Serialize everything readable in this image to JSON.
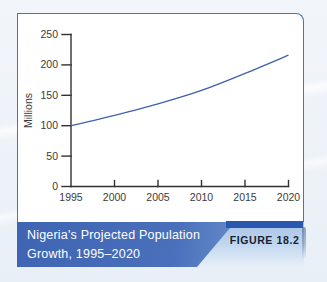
{
  "figure": {
    "caption_line1": "Nigeria's Projected Population",
    "caption_line2": "Growth, 1995–2020",
    "figure_label": "FIGURE 18.2"
  },
  "colors": {
    "panel_border": "#4a73b6",
    "line": "#3f63ab",
    "axis": "#323232",
    "tick_text": "#3b3b3b",
    "caption_text": "#ffffff",
    "figure_bar": "#2a58ae",
    "figure_label_color": "#141f38"
  },
  "chart_data": {
    "type": "line",
    "title": "Nigeria's Projected Population Growth, 1995–2020",
    "x": [
      1995,
      2000,
      2005,
      2010,
      2015,
      2020
    ],
    "series": [
      {
        "name": "Projected population (millions)",
        "values": [
          100,
          117,
          136,
          158,
          186,
          216
        ]
      }
    ],
    "xlabel": "",
    "ylabel": "Millions",
    "xlim": [
      1995,
      2020
    ],
    "ylim": [
      0,
      250
    ],
    "xticks": [
      1995,
      2000,
      2005,
      2010,
      2015,
      2020
    ],
    "yticks": [
      0,
      50,
      100,
      150,
      200,
      250
    ],
    "grid": false,
    "legend": "none"
  }
}
